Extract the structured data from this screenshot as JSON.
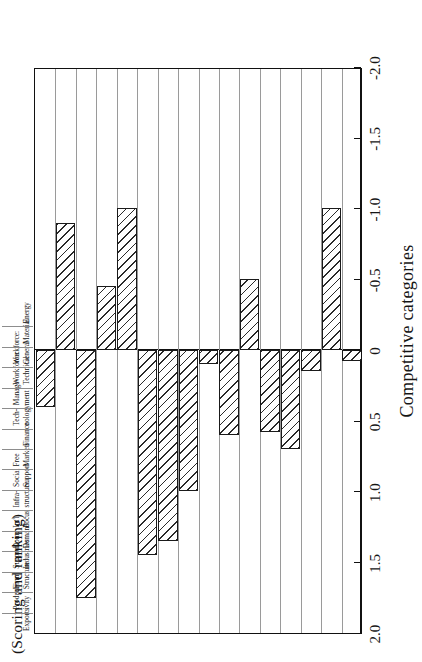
{
  "figure": {
    "y_caption": "(Scoring and ranking)",
    "x_caption": "Competitive categories"
  },
  "axis": {
    "tick_labels": [
      "2.0",
      "1.5",
      "1.0",
      "0.5",
      "0",
      "-0.5",
      "-1.0",
      "-1.5",
      "-2.0"
    ],
    "tick_values": [
      2.0,
      1.5,
      1.0,
      0.5,
      0,
      -0.5,
      -1.0,
      -1.5,
      -2.0
    ]
  },
  "categories": [
    {
      "line1": "Energy",
      "line2": ""
    },
    {
      "line1": "Material",
      "line2": ""
    },
    {
      "line1": "Workforce:",
      "line2": "General"
    },
    {
      "line1": "Workforce:",
      "line2": "Technical"
    },
    {
      "line1": "Manage-",
      "line2": "ment"
    },
    {
      "line1": "Tech-",
      "line2": "nology"
    },
    {
      "line1": "Finance",
      "line2": ""
    },
    {
      "line1": "Free",
      "line2": "Markets"
    },
    {
      "line1": "Social",
      "line2": "Support"
    },
    {
      "line1": "Infra-",
      "line2": "structure"
    },
    {
      "line1": "Int'l",
      "line2": "Focus"
    },
    {
      "line1": "Dom.",
      "line2": "Demand"
    },
    {
      "line1": "Support",
      "line2": "Industries"
    },
    {
      "line1": "Firm",
      "line2": "Structure"
    },
    {
      "line1": "Product-",
      "line2": "ivity"
    },
    {
      "line1": "Exports",
      "line2": ""
    }
  ],
  "chart_data": {
    "type": "bar",
    "orientation": "vertical-rotated",
    "title": "",
    "xlabel": "Competitive categories",
    "ylabel": "(Scoring and ranking)",
    "ylim": [
      -2.0,
      2.0
    ],
    "grid": true,
    "legend": null,
    "categories": [
      "Energy",
      "Material",
      "Workforce: General",
      "Workforce: Technical",
      "Management",
      "Technology",
      "Finance",
      "Free Markets",
      "Social Support",
      "Infrastructure",
      "Int'l Focus",
      "Dom. Demand",
      "Support Industries",
      "Firm Structure",
      "Productivity",
      "Exports"
    ],
    "values": [
      0.08,
      -1.0,
      0.15,
      0.7,
      0.58,
      -0.5,
      0.6,
      0.1,
      1.0,
      1.35,
      1.45,
      -1.0,
      -0.45,
      1.75,
      -0.9,
      0.4
    ]
  }
}
